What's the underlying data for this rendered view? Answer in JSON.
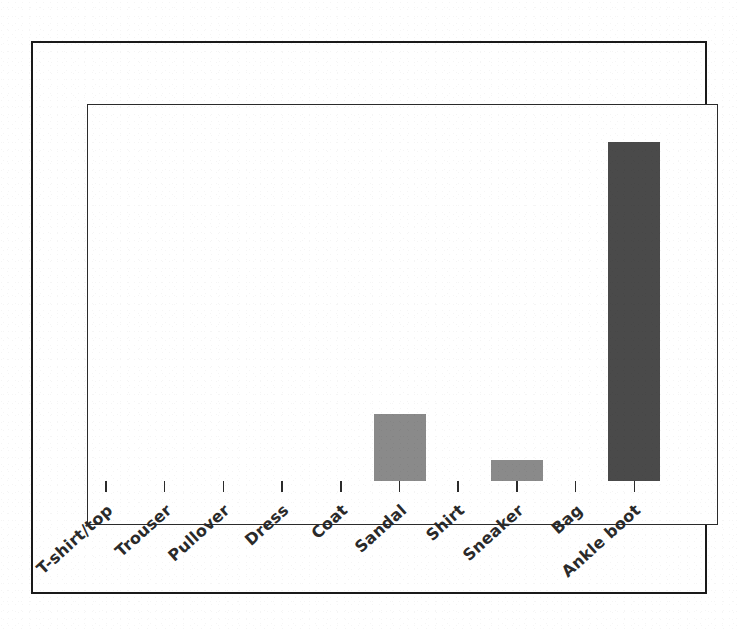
{
  "chart_data": {
    "type": "bar",
    "title": "",
    "subtitle": "",
    "xlabel": "",
    "ylabel": "",
    "categories": [
      "T-shirt/top",
      "Trouser",
      "Pullover",
      "Dress",
      "Coat",
      "Sandal",
      "Shirt",
      "Sneaker",
      "Bag",
      "Ankle boot"
    ],
    "values": [
      0,
      0,
      0,
      0,
      0,
      0.16,
      0,
      0.05,
      0,
      0.81
    ],
    "ylim": [
      0,
      1
    ],
    "grid": false,
    "legend": null,
    "tick_labels_rotated_deg": -42,
    "bars": [
      {
        "category": "T-shirt/top",
        "value": 0,
        "color": "#8a8a8a"
      },
      {
        "category": "Trouser",
        "value": 0,
        "color": "#8a8a8a"
      },
      {
        "category": "Pullover",
        "value": 0,
        "color": "#8a8a8a"
      },
      {
        "category": "Dress",
        "value": 0,
        "color": "#8a8a8a"
      },
      {
        "category": "Coat",
        "value": 0,
        "color": "#8a8a8a"
      },
      {
        "category": "Sandal",
        "value": 0.16,
        "color": "#8a8a8a"
      },
      {
        "category": "Shirt",
        "value": 0,
        "color": "#8a8a8a"
      },
      {
        "category": "Sneaker",
        "value": 0.05,
        "color": "#8a8a8a"
      },
      {
        "category": "Bag",
        "value": 0,
        "color": "#8a8a8a"
      },
      {
        "category": "Ankle boot",
        "value": 0.81,
        "color": "#4a4a4a"
      }
    ]
  },
  "colors": {
    "bar_light": "#8a8a8a",
    "bar_dark": "#4a4a4a",
    "axis": "#2b2b2b",
    "outer_frame": "#1a1a1a",
    "background": "#ffffff",
    "label_text": "#2a2a2a"
  }
}
